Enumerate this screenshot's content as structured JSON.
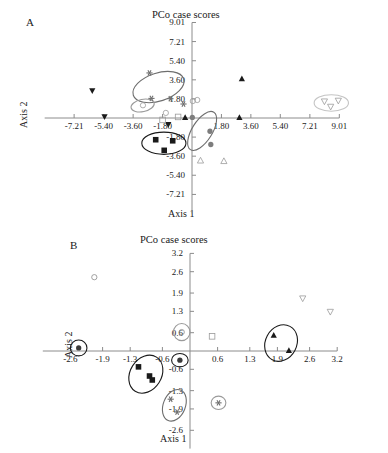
{
  "figure": {
    "panels": [
      {
        "id": "A",
        "letter": "A",
        "title": "PCo case scores",
        "xlabel": "Axis 1",
        "ylabel": "Axis 2"
      },
      {
        "id": "B",
        "letter": "B",
        "title": "PCo case scores",
        "xlabel": "Axis 1",
        "ylabel": "Axis 2"
      }
    ]
  },
  "chart_data": [
    {
      "type": "scatter",
      "panel": "A",
      "title": "PCo case scores",
      "xlabel": "Axis 1",
      "ylabel": "Axis 2",
      "xlim": [
        -9.01,
        9.01
      ],
      "ylim": [
        -9.01,
        9.01
      ],
      "xticks": [
        -7.21,
        -5.4,
        -3.6,
        -1.8,
        1.8,
        3.6,
        5.4,
        7.21,
        9.01
      ],
      "xtick_labels": [
        "-7.21",
        "-5.40",
        "-3.60",
        "-1.80",
        "1.80",
        "3.60",
        "5.40",
        "7.21",
        "9.01"
      ],
      "yticks": [
        9.01,
        7.21,
        5.4,
        3.6,
        1.8,
        -1.8,
        -3.6,
        -5.4,
        -7.21
      ],
      "ytick_labels": [
        "9.01",
        "7.21",
        "5.40",
        "3.60",
        "1.80",
        "-1.80",
        "-3.60",
        "-5.40",
        "-7.21"
      ],
      "grid": false,
      "legend": "none",
      "series": [
        {
          "name": "filled-triangle-down",
          "marker": "triangle-down-filled",
          "color": "#1a1a1a",
          "points": [
            {
              "x": -6.1,
              "y": 2.55
            },
            {
              "x": -5.35,
              "y": 0.1
            },
            {
              "x": -1.45,
              "y": -0.62
            }
          ]
        },
        {
          "name": "filled-triangle-up",
          "marker": "triangle-up-filled",
          "color": "#1a1a1a",
          "points": [
            {
              "x": 3.05,
              "y": 3.72
            },
            {
              "x": 2.9,
              "y": 0.05
            },
            {
              "x": -0.42,
              "y": 0.05
            }
          ]
        },
        {
          "name": "open-triangle-down",
          "marker": "triangle-down-open",
          "color": "#9a9a9a",
          "points": [
            {
              "x": 8.1,
              "y": 1.55
            },
            {
              "x": 8.95,
              "y": 1.62
            },
            {
              "x": 8.48,
              "y": 1.05
            }
          ]
        },
        {
          "name": "open-triangle-up",
          "marker": "triangle-up-open",
          "color": "#9a9a9a",
          "points": [
            {
              "x": 0.52,
              "y": -4.0
            },
            {
              "x": 1.95,
              "y": -4.05
            }
          ]
        },
        {
          "name": "filled-square",
          "marker": "square-filled",
          "color": "#1a1a1a",
          "points": [
            {
              "x": -2.22,
              "y": -2.05
            },
            {
              "x": -1.18,
              "y": -2.15
            },
            {
              "x": -1.7,
              "y": -3.05
            }
          ]
        },
        {
          "name": "open-square",
          "marker": "square-open",
          "color": "#9a9a9a",
          "points": [
            {
              "x": -0.85,
              "y": 0.1
            },
            {
              "x": -1.8,
              "y": -0.18
            }
          ]
        },
        {
          "name": "gray-asterisk",
          "marker": "asterisk",
          "color": "#6e6e6e",
          "points": [
            {
              "x": -2.6,
              "y": 4.25
            },
            {
              "x": -2.48,
              "y": 1.85
            },
            {
              "x": -1.32,
              "y": 1.82
            },
            {
              "x": -0.52,
              "y": 1.32
            }
          ]
        },
        {
          "name": "gray-circle-cluster",
          "marker": "circle-open",
          "color": "#9a9a9a",
          "points": [
            {
              "x": -3.0,
              "y": 1.2
            },
            {
              "x": -1.6,
              "y": 0.48
            },
            {
              "x": 0.05,
              "y": 1.6
            },
            {
              "x": 0.32,
              "y": 1.7
            }
          ]
        },
        {
          "name": "gray-filled-circle",
          "marker": "circle-filled",
          "color": "#7d7d7d",
          "points": [
            {
              "x": 0.02,
              "y": 0.05
            },
            {
              "x": 1.1,
              "y": -1.25
            },
            {
              "x": 1.15,
              "y": -2.5
            }
          ]
        }
      ],
      "ellipses": [
        {
          "name": "asterisk-group",
          "cx": -2.05,
          "cy": 2.92,
          "rx": 1.62,
          "ry": 1.32,
          "angle": -18,
          "stroke": "#6e6e6e"
        },
        {
          "name": "circle-small-group",
          "cx": -3.02,
          "cy": 1.18,
          "rx": 0.72,
          "ry": 0.58,
          "angle": -12,
          "stroke": "#9a9a9a"
        },
        {
          "name": "square-group",
          "cx": -1.72,
          "cy": -2.38,
          "rx": 1.35,
          "ry": 1.05,
          "angle": 0,
          "stroke": "#1a1a1a"
        },
        {
          "name": "filled-circle-group",
          "cx": 0.62,
          "cy": -1.22,
          "rx": 1.35,
          "ry": 0.95,
          "angle": -58,
          "stroke": "#6e6e6e"
        },
        {
          "name": "open-triangle-down-group",
          "cx": 8.52,
          "cy": 1.42,
          "rx": 1.05,
          "ry": 0.78,
          "angle": 0,
          "stroke": "#c4c4c4"
        }
      ]
    },
    {
      "type": "scatter",
      "panel": "B",
      "title": "PCo case scores",
      "xlabel": "Axis 1",
      "ylabel": "Axis 2",
      "xlim": [
        -3.2,
        3.2
      ],
      "ylim": [
        -3.2,
        3.2
      ],
      "xticks": [
        -2.6,
        -1.9,
        -1.3,
        -0.6,
        0.6,
        1.3,
        1.9,
        2.6,
        3.2
      ],
      "xtick_labels": [
        "-2.6",
        "-1.9",
        "-1.3",
        "-0.6",
        "0.6",
        "1.3",
        "1.9",
        "2.6",
        "3.2"
      ],
      "yticks": [
        3.2,
        2.6,
        1.9,
        1.3,
        0.6,
        -0.6,
        -1.3,
        -1.9,
        -2.6
      ],
      "ytick_labels": [
        "3.2",
        "2.6",
        "1.9",
        "1.3",
        "0.6",
        "-0.6",
        "-1.3",
        "-1.9",
        "-2.6"
      ],
      "grid": false,
      "legend": "none",
      "series": [
        {
          "name": "gray-circle-spiral",
          "marker": "circle-open",
          "color": "#8a8a8a",
          "points": [
            {
              "x": -2.08,
              "y": 2.42
            },
            {
              "x": -0.18,
              "y": 0.62
            }
          ]
        },
        {
          "name": "dark-filled-circle",
          "marker": "circle-filled",
          "color": "#3a3a3a",
          "points": [
            {
              "x": -2.42,
              "y": 0.1
            },
            {
              "x": -0.22,
              "y": -0.3
            }
          ]
        },
        {
          "name": "open-square",
          "marker": "square-open",
          "color": "#9a9a9a",
          "points": [
            {
              "x": 0.48,
              "y": 0.48
            }
          ]
        },
        {
          "name": "filled-triangle-up",
          "marker": "triangle-up-filled",
          "color": "#1a1a1a",
          "points": [
            {
              "x": 1.82,
              "y": 0.52
            },
            {
              "x": 2.15,
              "y": 0.02
            }
          ]
        },
        {
          "name": "open-triangle-down",
          "marker": "triangle-down-open",
          "color": "#9a9a9a",
          "points": [
            {
              "x": 2.45,
              "y": 1.72
            },
            {
              "x": 3.05,
              "y": 1.28
            }
          ]
        },
        {
          "name": "filled-square",
          "marker": "square-filled",
          "color": "#1a1a1a",
          "points": [
            {
              "x": -1.12,
              "y": -0.52
            },
            {
              "x": -0.88,
              "y": -0.82
            },
            {
              "x": -0.82,
              "y": -0.95
            }
          ]
        },
        {
          "name": "gray-asterisk",
          "marker": "asterisk",
          "color": "#6e6e6e",
          "points": [
            {
              "x": -0.42,
              "y": -1.58
            },
            {
              "x": -0.28,
              "y": -2.0
            },
            {
              "x": 0.62,
              "y": -1.7
            }
          ]
        }
      ],
      "ellipses": [
        {
          "name": "dark-circle-left-group",
          "cx": -2.42,
          "cy": 0.1,
          "rx": 0.18,
          "ry": 0.26,
          "angle": 0,
          "stroke": "#1a1a1a"
        },
        {
          "name": "triangle-up-group",
          "cx": 1.98,
          "cy": 0.26,
          "rx": 0.34,
          "ry": 0.62,
          "angle": 28,
          "stroke": "#1a1a1a"
        },
        {
          "name": "square-group",
          "cx": -0.96,
          "cy": -0.76,
          "rx": 0.34,
          "ry": 0.66,
          "angle": 32,
          "stroke": "#1a1a1a"
        },
        {
          "name": "asterisk-group",
          "cx": -0.34,
          "cy": -1.78,
          "rx": 0.24,
          "ry": 0.54,
          "angle": 22,
          "stroke": "#6e6e6e"
        },
        {
          "name": "asterisk-single-group",
          "cx": 0.62,
          "cy": -1.7,
          "rx": 0.16,
          "ry": 0.22,
          "angle": 0,
          "stroke": "#9a9a9a"
        },
        {
          "name": "circle-center-group",
          "cx": -0.18,
          "cy": 0.62,
          "rx": 0.18,
          "ry": 0.28,
          "angle": 0,
          "stroke": "#9a9a9a"
        },
        {
          "name": "dark-circle-center-group",
          "cx": -0.22,
          "cy": -0.3,
          "rx": 0.18,
          "ry": 0.22,
          "angle": 0,
          "stroke": "#1a1a1a"
        }
      ]
    }
  ]
}
